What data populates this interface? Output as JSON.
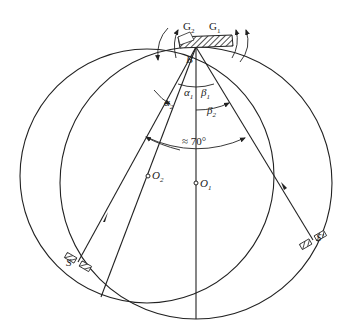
{
  "figure": {
    "header_fragment": "",
    "labels": {
      "G2": {
        "base": "G",
        "sub": "2"
      },
      "G1": {
        "base": "G",
        "sub": "1"
      },
      "B": "B",
      "alpha1": {
        "base": "α",
        "sub": "1"
      },
      "alpha2": {
        "base": "α",
        "sub": "2"
      },
      "beta1": {
        "base": "β",
        "sub": "1"
      },
      "beta2": {
        "base": "β",
        "sub": "2"
      },
      "angle": "≈ 70°",
      "O1": {
        "base": "O",
        "sub": "1"
      },
      "O2": {
        "base": "O",
        "sub": "2"
      },
      "S": "S",
      "S_prime": "S'"
    },
    "geometry": {
      "B": [
        196,
        47
      ],
      "O1": [
        196,
        183
      ],
      "O2": [
        147,
        176
      ],
      "S": [
        78,
        262
      ],
      "S_prime": [
        313,
        240
      ],
      "circle1_radius": 136,
      "circle2_radius": 127
    },
    "colors": {
      "ink": "#222222",
      "background": "#ffffff"
    }
  }
}
